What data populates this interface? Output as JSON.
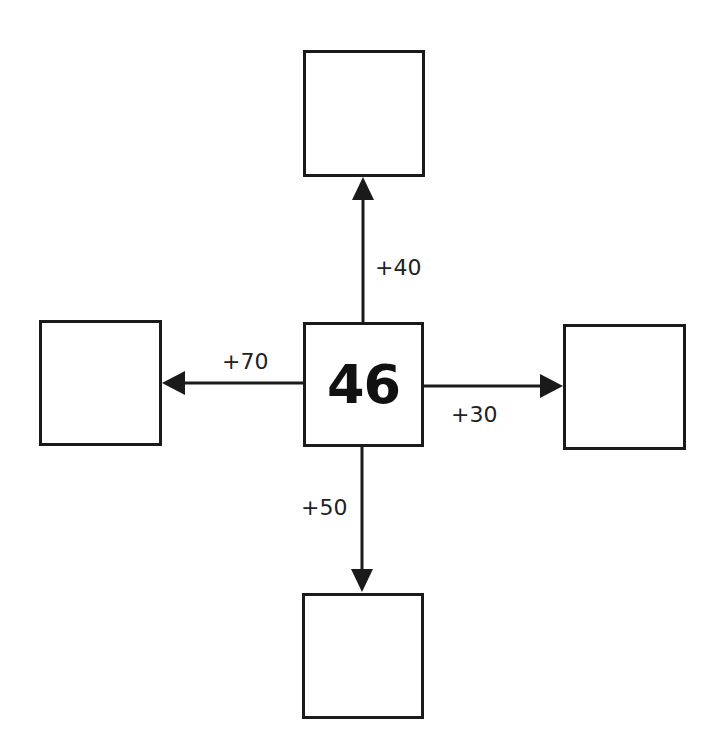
{
  "diagram": {
    "type": "number-web",
    "center": {
      "value": "46"
    },
    "branches": [
      {
        "direction": "up",
        "operation": "+40",
        "result": ""
      },
      {
        "direction": "left",
        "operation": "+70",
        "result": ""
      },
      {
        "direction": "right",
        "operation": "+30",
        "result": ""
      },
      {
        "direction": "down",
        "operation": "+50",
        "result": ""
      }
    ],
    "colors": {
      "stroke": "#1a1a1a",
      "background": "#ffffff",
      "text": "#222222"
    }
  }
}
